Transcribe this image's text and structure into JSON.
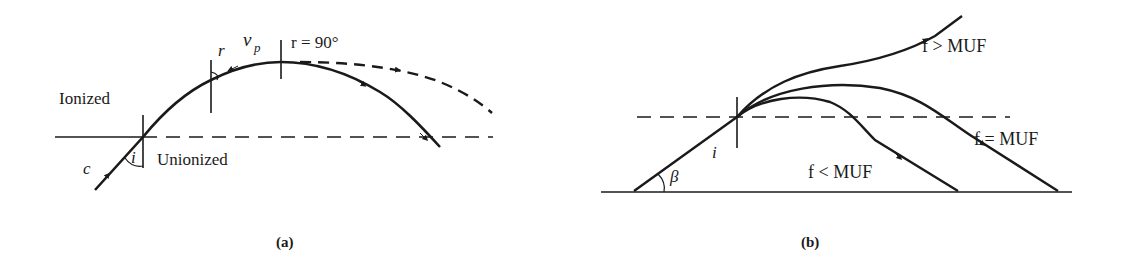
{
  "panel_a": {
    "caption": "(a)",
    "region_upper": "Ionized",
    "region_lower": "Unionized",
    "labels": {
      "c": "c",
      "i": "i",
      "r": "r",
      "vp": "v",
      "vp_sub": "p",
      "r90": "r = 90°"
    }
  },
  "panel_b": {
    "caption": "(b)",
    "labels": {
      "i": "i",
      "beta": "β",
      "f_greater": "f > MUF",
      "f_equal": "f = MUF",
      "f_less": "f < MUF"
    }
  },
  "colors": {
    "ink": "#1a1a1a",
    "background": "#ffffff"
  }
}
